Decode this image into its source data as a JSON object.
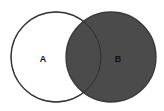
{
  "diagram": {
    "type": "venn",
    "sets": [
      {
        "label": "A",
        "shaded": false,
        "fill": "#ffffff",
        "stroke": "#5a5a5a",
        "cx": 56,
        "cy": 57,
        "r": 45
      },
      {
        "label": "B",
        "shaded": true,
        "fill": "#4b4b4b",
        "stroke": "#3a3a3a",
        "cx": 111,
        "cy": 57,
        "r": 45
      }
    ],
    "label_color": "#111111"
  }
}
